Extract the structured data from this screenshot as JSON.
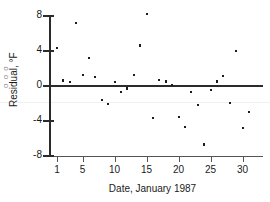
{
  "chart_data": {
    "type": "scatter",
    "title": "",
    "xlabel": "Date, January 1987",
    "ylabel": "Residual, °F",
    "xlim": [
      0,
      32
    ],
    "ylim": [
      -8,
      8
    ],
    "xticks": [
      1,
      5,
      10,
      15,
      20,
      25,
      30
    ],
    "xtick_labels": [
      "1",
      "5",
      "10",
      "15",
      "20",
      "25",
      "30"
    ],
    "yticks": [
      8,
      4,
      0,
      -4,
      -8
    ],
    "ytick_labels": [
      "8",
      "4",
      "0",
      "-4",
      "-8"
    ],
    "grid": false,
    "legend": null,
    "reference_line": {
      "orientation": "horizontal",
      "y": 0
    },
    "marker": "square",
    "marker_color": "#1c1c1c",
    "x": [
      1,
      2,
      3,
      4,
      5,
      6,
      7,
      8,
      9,
      10,
      11,
      12,
      13,
      14,
      15,
      16,
      17,
      18,
      19,
      20,
      21,
      22,
      23,
      24,
      25,
      26,
      27,
      28,
      29,
      30,
      31
    ],
    "y": [
      4.3,
      0.6,
      0.4,
      7.2,
      1.2,
      3.2,
      1.0,
      -1.6,
      -2.1,
      0.4,
      -0.7,
      -0.3,
      1.2,
      4.6,
      8.2,
      -3.7,
      0.7,
      0.5,
      0.1,
      -3.6,
      -4.7,
      -0.7,
      -2.2,
      -6.7,
      -0.5,
      0.5,
      1.1,
      -2.0,
      4.0,
      -4.8,
      -3.0
    ],
    "points": [
      {
        "day": 1,
        "residual": 4.3
      },
      {
        "day": 2,
        "residual": 0.6
      },
      {
        "day": 3,
        "residual": 0.4
      },
      {
        "day": 4,
        "residual": 7.2
      },
      {
        "day": 5,
        "residual": 1.2
      },
      {
        "day": 6,
        "residual": 3.2
      },
      {
        "day": 7,
        "residual": 1.0
      },
      {
        "day": 8,
        "residual": -1.6
      },
      {
        "day": 9,
        "residual": -2.1
      },
      {
        "day": 10,
        "residual": 0.4
      },
      {
        "day": 11,
        "residual": -0.7
      },
      {
        "day": 12,
        "residual": -0.3
      },
      {
        "day": 13,
        "residual": 1.2
      },
      {
        "day": 14,
        "residual": 4.6
      },
      {
        "day": 15,
        "residual": 8.2
      },
      {
        "day": 16,
        "residual": -3.7
      },
      {
        "day": 17,
        "residual": 0.7
      },
      {
        "day": 18,
        "residual": 0.5
      },
      {
        "day": 19,
        "residual": 0.1
      },
      {
        "day": 20,
        "residual": -3.6
      },
      {
        "day": 21,
        "residual": -4.7
      },
      {
        "day": 22,
        "residual": -0.7
      },
      {
        "day": 23,
        "residual": -2.2
      },
      {
        "day": 24,
        "residual": -6.7
      },
      {
        "day": 25,
        "residual": -0.5
      },
      {
        "day": 26,
        "residual": 0.5
      },
      {
        "day": 27,
        "residual": 1.1
      },
      {
        "day": 28,
        "residual": -2.0
      },
      {
        "day": 29,
        "residual": 4.0
      },
      {
        "day": 30,
        "residual": -4.8
      },
      {
        "day": 31,
        "residual": -3.0
      }
    ]
  },
  "edge_ghost_text": "o o o"
}
